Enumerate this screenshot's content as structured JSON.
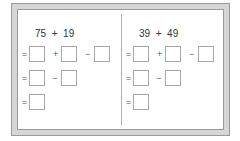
{
  "panels": [
    {
      "a": "75",
      "op": "+",
      "b": "19",
      "rows": [
        {
          "eq": "=",
          "ops": [
            "+",
            "−"
          ],
          "boxes": 3
        },
        {
          "eq": "=",
          "ops": [
            "−"
          ],
          "boxes": 2
        },
        {
          "eq": "=",
          "ops": [],
          "boxes": 1
        }
      ]
    },
    {
      "a": "39",
      "op": "+",
      "b": "49",
      "rows": [
        {
          "eq": "=",
          "ops": [
            "+",
            "−"
          ],
          "boxes": 3
        },
        {
          "eq": "=",
          "ops": [
            "−"
          ],
          "boxes": 2
        },
        {
          "eq": "=",
          "ops": [],
          "boxes": 1
        }
      ]
    }
  ]
}
